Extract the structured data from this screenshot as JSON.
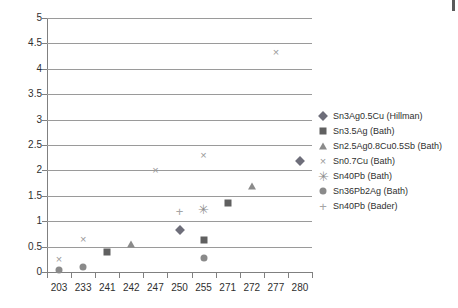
{
  "chart_data": {
    "type": "scatter",
    "title": "",
    "xlabel": "",
    "ylabel": "",
    "categories": [
      "203",
      "233",
      "241",
      "242",
      "247",
      "250",
      "255",
      "271",
      "272",
      "277",
      "280"
    ],
    "ylim": [
      0,
      5
    ],
    "ytick_labels": [
      "0",
      "0.5",
      "1",
      "1.5",
      "2",
      "2.5",
      "3",
      "3.5",
      "4",
      "4.5",
      "5"
    ],
    "ytick_values": [
      0,
      0.5,
      1,
      1.5,
      2,
      2.5,
      3,
      3.5,
      4,
      4.5,
      5
    ],
    "grid": true,
    "legend_position": "right",
    "series": [
      {
        "name": "Sn3Ag0.5Cu (Hillman)",
        "marker": "diamond",
        "color": "#6e6e7a",
        "points": [
          {
            "x": "250",
            "y": 0.82
          },
          {
            "x": "280",
            "y": 2.18
          }
        ]
      },
      {
        "name": "Sn3.5Ag (Bath)",
        "marker": "square",
        "color": "#606060",
        "points": [
          {
            "x": "241",
            "y": 0.4
          },
          {
            "x": "255",
            "y": 0.63
          },
          {
            "x": "271",
            "y": 1.35
          }
        ]
      },
      {
        "name": "Sn2.5Ag0.8Cu0.5Sb (Bath)",
        "marker": "triangle",
        "color": "#8b8b8b",
        "points": [
          {
            "x": "242",
            "y": 0.55
          },
          {
            "x": "272",
            "y": 1.7
          }
        ]
      },
      {
        "name": "Sn0.7Cu (Bath)",
        "marker": "cross",
        "color": "#9a9a9a",
        "points": [
          {
            "x": "203",
            "y": 0.25
          },
          {
            "x": "233",
            "y": 0.65
          },
          {
            "x": "247",
            "y": 2.0
          },
          {
            "x": "255",
            "y": 2.3
          },
          {
            "x": "277",
            "y": 4.33
          }
        ]
      },
      {
        "name": "Sn40Pb (Bath)",
        "marker": "asterisk",
        "color": "#8f8f8f",
        "points": [
          {
            "x": "255",
            "y": 1.25
          }
        ]
      },
      {
        "name": "Sn36Pb2Ag (Bath)",
        "marker": "circle",
        "color": "#8a8a8a",
        "points": [
          {
            "x": "203",
            "y": 0.03
          },
          {
            "x": "233",
            "y": 0.1
          },
          {
            "x": "255",
            "y": 0.28
          }
        ]
      },
      {
        "name": "Sn40Pb (Bader)",
        "marker": "plus",
        "color": "#a5a5a5",
        "points": [
          {
            "x": "250",
            "y": 1.2
          }
        ]
      }
    ]
  }
}
